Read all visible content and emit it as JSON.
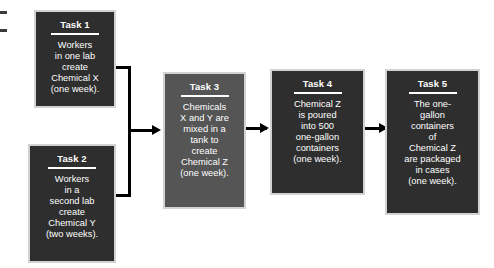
{
  "diagram": {
    "colors": {
      "box_dark": "#2e2e2e",
      "box_mid": "#555555",
      "box_border": "#d2d2d2",
      "connector": "#000000",
      "text": "#ffffff",
      "background": "#ffffff"
    },
    "tasks": [
      {
        "id": "task-1",
        "title": "Task 1",
        "body": "Workers\nin one lab\ncreate\nChemical X\n(one week).",
        "duration": "one week",
        "shade": "dark"
      },
      {
        "id": "task-2",
        "title": "Task 2",
        "body": "Workers\nin a\nsecond lab\ncreate\nChemical Y\n(two weeks).",
        "duration": "two weeks",
        "shade": "dark"
      },
      {
        "id": "task-3",
        "title": "Task 3",
        "body": "Chemicals\nX and Y are\nmixed in a\ntank to\ncreate\nChemical Z\n(one week).",
        "duration": "one week",
        "shade": "mid"
      },
      {
        "id": "task-4",
        "title": "Task 4",
        "body": "Chemical Z\nis poured\ninto 500\none-gallon\ncontainers\n(one week).",
        "duration": "one week",
        "shade": "dark"
      },
      {
        "id": "task-5",
        "title": "Task 5",
        "body": "The one-\ngallon\ncontainers\nof\nChemical Z\nare packaged\nin cases\n(one week).",
        "duration": "one week",
        "shade": "dark"
      }
    ],
    "connectors": [
      {
        "id": "merge-task1-task2-to-task3",
        "from": [
          "task-1",
          "task-2"
        ],
        "to": "task-3",
        "style": "merge-elbow-arrow"
      },
      {
        "id": "task3-to-task4",
        "from": [
          "task-3"
        ],
        "to": "task-4",
        "style": "straight-arrow"
      },
      {
        "id": "task4-to-task5",
        "from": [
          "task-4"
        ],
        "to": "task-5",
        "style": "straight-arrow"
      }
    ]
  }
}
